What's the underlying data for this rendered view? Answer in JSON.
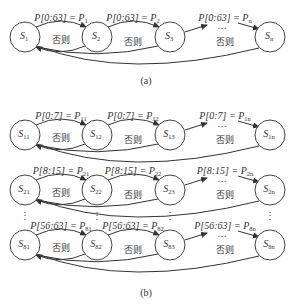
{
  "figure_a": {
    "caption": "(a)",
    "nodes": [
      {
        "name": "S",
        "sub": "1"
      },
      {
        "name": "S",
        "sub": "2"
      },
      {
        "name": "S",
        "sub": "3"
      },
      {
        "name": "S",
        "sub": "n"
      }
    ],
    "transitions": [
      {
        "cond": "P[0:63] = P",
        "sub": "1"
      },
      {
        "cond": "P[0:63] = P",
        "sub": "2"
      },
      {
        "cond": "P[0:63] = P",
        "sub": "n"
      }
    ],
    "else_label": "否则",
    "ellipsis": "…"
  },
  "figure_b": {
    "caption": "(b)",
    "rows": [
      {
        "nodes": [
          {
            "name": "S",
            "sub": "11"
          },
          {
            "name": "S",
            "sub": "12"
          },
          {
            "name": "S",
            "sub": "13"
          },
          {
            "name": "S",
            "sub": "1n"
          }
        ],
        "transitions": [
          {
            "cond": "P[0:7] = P",
            "sub": "11"
          },
          {
            "cond": "P[0:7] = P",
            "sub": "12"
          },
          {
            "cond": "P[0:7] = P",
            "sub": "1n"
          }
        ]
      },
      {
        "nodes": [
          {
            "name": "S",
            "sub": "21"
          },
          {
            "name": "S",
            "sub": "22"
          },
          {
            "name": "S",
            "sub": "23"
          },
          {
            "name": "S",
            "sub": "2n"
          }
        ],
        "transitions": [
          {
            "cond": "P[8:15] = P",
            "sub": "21"
          },
          {
            "cond": "P[8:15] = P",
            "sub": "22"
          },
          {
            "cond": "P[8:15] = P",
            "sub": "2n"
          }
        ]
      },
      {
        "nodes": [
          {
            "name": "S",
            "sub": "81"
          },
          {
            "name": "S",
            "sub": "82"
          },
          {
            "name": "S",
            "sub": "83"
          },
          {
            "name": "S",
            "sub": "8n"
          }
        ],
        "transitions": [
          {
            "cond": "P[56:63] = P",
            "sub": "81"
          },
          {
            "cond": "P[56:63] = P",
            "sub": "82"
          },
          {
            "cond": "P[56:63] = P",
            "sub": "8n"
          }
        ]
      }
    ],
    "else_label": "否则",
    "ellipsis": "…",
    "vertical_ellipsis": "⋮"
  }
}
